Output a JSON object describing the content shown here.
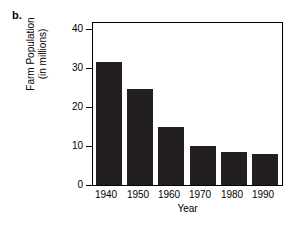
{
  "figure": {
    "panel_label": "b."
  },
  "chart_data": {
    "type": "bar",
    "title": "",
    "xlabel": "Year",
    "ylabel_line1": "Farm Population",
    "ylabel_line2": "(in millions)",
    "categories": [
      "1940",
      "1950",
      "1960",
      "1970",
      "1980",
      "1990"
    ],
    "values": [
      32,
      25,
      15,
      10,
      8.5,
      8
    ],
    "ylim": [
      0,
      42
    ],
    "yticks": [
      0,
      10,
      20,
      30,
      40
    ],
    "ytick_labels": [
      "0",
      "10",
      "20",
      "30",
      "40"
    ],
    "grid": false,
    "legend": "none",
    "bar_color": "#231f20",
    "axis_color": "#000000",
    "background_color": "#ffffff"
  }
}
